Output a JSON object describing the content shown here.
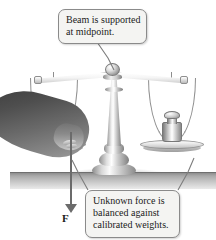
{
  "figure": {
    "background_color": "#ffffff"
  },
  "callouts": [
    {
      "id": "beam-support",
      "lines": [
        "Beam is supported",
        "at midpoint."
      ],
      "box_color": "#f4f4f2",
      "border_color": "#8a8a8a"
    },
    {
      "id": "force-balance",
      "lines": [
        "Unknown force is",
        "balanced against",
        "calibrated weights."
      ],
      "box_color": "#f4f4f2",
      "border_color": "#8a8a8a"
    }
  ],
  "labels": {
    "force_vector": "F"
  },
  "apparatus": {
    "beam": "balance-beam",
    "fulcrum": "pivot-knob",
    "column": "support-column",
    "base": "flared-base",
    "left_pan": "left-balance-pan",
    "right_pan": "right-balance-pan",
    "weight": "calibrated-weight",
    "hand": "hand-pressing-pan",
    "surface": "table-surface"
  },
  "colors": {
    "metal_light": "#ffffff",
    "metal_mid": "#c0c0c0",
    "metal_dark": "#7d7d7d",
    "arrow": "#6b6b6b",
    "text": "#1b1b1b",
    "table": "#a9a9a9"
  }
}
